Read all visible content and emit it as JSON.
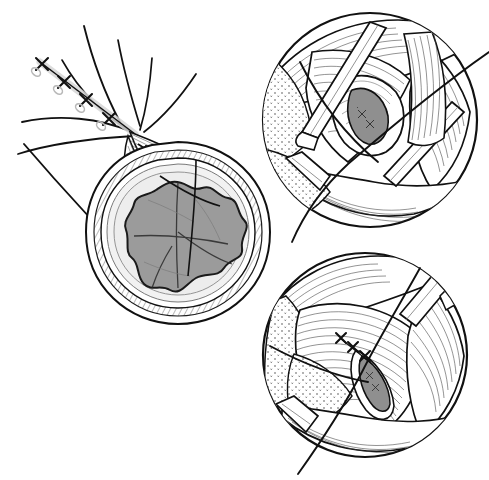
{
  "figure": {
    "domain_kind": "medical-line-drawing",
    "background_color": "#ffffff",
    "ink_color": "#111111",
    "canvas": {
      "width": 489,
      "height": 480
    },
    "panels": [
      {
        "id": "panel-main",
        "label": "Cross-sectional view with everted tissue cone and suture line",
        "shape": "teardrop-cross-section",
        "center": {
          "x": 178,
          "y": 232
        },
        "radius": 88,
        "layers": [
          {
            "name": "outer-capsule",
            "fill": "#ffffff",
            "stroke": "#111111",
            "texture": "hatched"
          },
          {
            "name": "middle-wall",
            "fill": "#f1f1f1",
            "stroke": "#111111",
            "texture": "smooth"
          },
          {
            "name": "submucosa-ring",
            "fill": "#e6e6e6",
            "stroke": "#777777",
            "texture": "smooth"
          },
          {
            "name": "inner-mass",
            "fill": "#9b9b9b",
            "stroke": "#1a1a1a",
            "texture": "scalloped"
          }
        ],
        "apex": {
          "x": 72,
          "y": 118
        },
        "suture_knots": 4,
        "knot_glyph": "x-knot",
        "thread_count": 8
      },
      {
        "id": "panel-top-inset",
        "label": "Magnified view: incision opened with retractors exposing lumen",
        "shape": "circle",
        "center": {
          "x": 370,
          "y": 120
        },
        "radius": 108,
        "features": [
          "retractor-blade-upper",
          "retractor-blade-lower",
          "retractor-blade-left",
          "muscle-striations",
          "stippled-serosa",
          "open-incision-lens",
          "suture-thread-long"
        ],
        "incision": {
          "state": "open",
          "fill": "#8f8f8f",
          "cx": 373,
          "cy": 113
        }
      },
      {
        "id": "panel-bottom-inset",
        "label": "Magnified view: incision closed with three interrupted sutures",
        "shape": "circle",
        "center": {
          "x": 365,
          "y": 355
        },
        "radius": 103,
        "features": [
          "retractor-blade-upper-right",
          "retractor-blade-lower-left",
          "muscle-striations",
          "stippled-serosa",
          "closed-incision-lens",
          "interrupted-sutures",
          "suture-thread-long"
        ],
        "incision": {
          "state": "closed",
          "fill": "#8f8f8f",
          "cx": 372,
          "cy": 378
        },
        "suture_knots": 3,
        "knot_glyph": "x-knot"
      }
    ],
    "palette": {
      "ink": "#111111",
      "hairline": "#4a4a4a",
      "tissue_gray": "#9b9b9b",
      "tissue_light": "#f1f1f1",
      "tissue_mid": "#e6e6e6",
      "lumen_gray": "#8f8f8f",
      "background": "#ffffff"
    }
  }
}
